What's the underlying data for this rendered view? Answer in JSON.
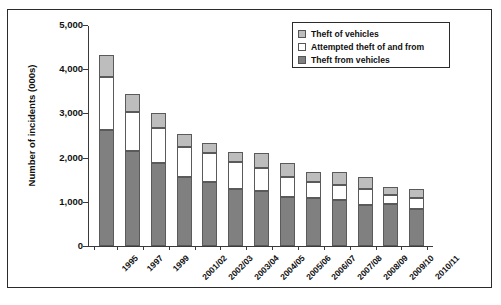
{
  "chart_data": {
    "type": "bar",
    "title": "",
    "subtitle": "",
    "xlabel": "",
    "ylabel": "Number of incidents (000s)",
    "ylim": [
      0,
      5000
    ],
    "ytick_labels": [
      "5,000",
      "4,000",
      "3,000",
      "2,000",
      "1,000",
      "0"
    ],
    "ytick_values": [
      5000,
      4000,
      3000,
      2000,
      1000,
      0
    ],
    "grid": false,
    "stacked": true,
    "legend_position": "top-right",
    "categories": [
      "1995",
      "1997",
      "1999",
      "2001/02",
      "2002/03",
      "2003/04",
      "2004/05",
      "2005/06",
      "2006/07",
      "2007/08",
      "2008/09",
      "2009/10",
      "2010/11"
    ],
    "series": [
      {
        "name": "Theft from vehicles",
        "color": "#808080",
        "values": [
          2630,
          2150,
          1870,
          1550,
          1450,
          1300,
          1250,
          1100,
          1080,
          1050,
          930,
          960,
          840
        ]
      },
      {
        "name": "Attempted theft of and from",
        "color": "#ffffff",
        "values": [
          1190,
          890,
          800,
          690,
          650,
          600,
          520,
          470,
          360,
          330,
          350,
          200,
          240
        ]
      },
      {
        "name": "Theft of vehicles",
        "color": "#bdbdbd",
        "values": [
          490,
          400,
          330,
          300,
          230,
          220,
          330,
          300,
          240,
          285,
          285,
          175,
          200
        ]
      }
    ],
    "totals": [
      4310,
      3440,
      3000,
      2540,
      2330,
      2120,
      2100,
      1870,
      1680,
      1665,
      1565,
      1335,
      1280
    ]
  },
  "legend": {
    "items": [
      {
        "label": "Theft of vehicles",
        "swatch": "light"
      },
      {
        "label": "Attempted theft of and from",
        "swatch": "white"
      },
      {
        "label": "Theft from vehicles",
        "swatch": "dark"
      }
    ]
  }
}
